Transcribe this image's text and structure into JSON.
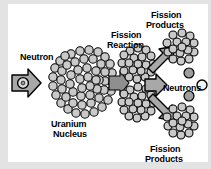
{
  "figure": {
    "panel_background": "#ffffff",
    "outer_background": "#e3e3e3",
    "labels": {
      "neutron": "Neutron",
      "uranium_line1": "Uranium",
      "uranium_line2": "Nucleus",
      "fission_reaction_line1": "Fission",
      "fission_reaction_line2": "Reaction",
      "fission_products_top_line1": "Fission",
      "fission_products_top_line2": "Products",
      "fission_products_bottom_line1": "Fission",
      "fission_products_bottom_line2": "Products",
      "neutrons": "Neutrons"
    },
    "colors": {
      "outline": "#000000",
      "nucleon_fill": "#c9c9c9",
      "arrow_fill": "#a8a8a8",
      "text": "#000000",
      "panel": "#ffffff",
      "margin": "#e3e3e3"
    },
    "elements": {
      "incoming_neutron_arrow": "arrow-right-with-neutron",
      "uranium_nucleus": "large-nucleon-cluster",
      "splitting_nucleus": "two-lobe-nucleon-cluster",
      "fission_product_top": "small-nucleon-cluster",
      "fission_product_bottom": "small-nucleon-cluster",
      "released_neutrons_count": 3
    }
  }
}
